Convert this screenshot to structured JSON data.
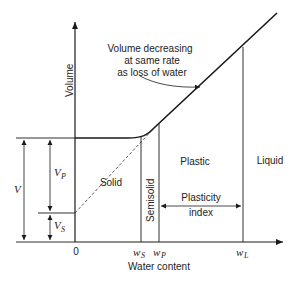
{
  "diagram": {
    "type": "atterberg-limits-volume-vs-water-content",
    "y_axis_label": "Volume",
    "x_axis_label": "Water content",
    "origin_label": "0",
    "annotation": [
      "Volume decreasing",
      "at same rate",
      "as loss of water"
    ],
    "regions": {
      "solid": "Solid",
      "semisolid": "Semisolid",
      "plastic": "Plastic",
      "liquid": "Liquid"
    },
    "plasticity_index": [
      "Plasticity",
      "index"
    ],
    "x_markers": [
      {
        "symbol": "w",
        "sub": "S"
      },
      {
        "symbol": "w",
        "sub": "P"
      },
      {
        "symbol": "w",
        "sub": "L"
      }
    ],
    "volume_dims": {
      "total": "V",
      "plastic": {
        "symbol": "V",
        "sub": "P"
      },
      "solid": {
        "symbol": "V",
        "sub": "S"
      }
    },
    "colors": {
      "line": "#1a1a1a",
      "background": "#ffffff"
    }
  }
}
